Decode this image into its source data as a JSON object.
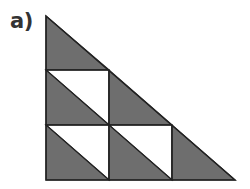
{
  "label": "a)",
  "figure": {
    "fill_color": "#6e6e6e",
    "stroke_color": "#222222",
    "rows": 3,
    "shaded_triangles": 6,
    "white_triangles": 3
  }
}
